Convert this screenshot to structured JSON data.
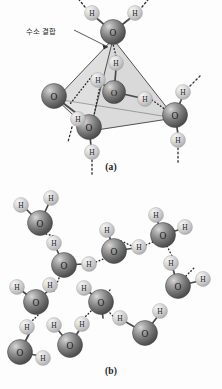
{
  "figure": {
    "background_color": "#fdfdfd",
    "annotations": {
      "hydrogen_bond_label": "수소 결합"
    },
    "captions": {
      "panel_a": "(a)",
      "panel_b": "(b)"
    },
    "atom_labels": {
      "oxygen": "O",
      "hydrogen": "H"
    },
    "colors": {
      "oxygen_sphere_dark": "#4f4f4f",
      "oxygen_sphere_mid": "#7d7d7d",
      "oxygen_sphere_light": "#b9b9b9",
      "hydrogen_sphere_dark": "#b0b0b0",
      "hydrogen_sphere_mid": "#d2d2d2",
      "hydrogen_sphere_light": "#eeeeee",
      "bond_line": "#4a4a4a",
      "hbond_dotted": "#3a3a3a",
      "tetrahedron_face": "#c9c9c9",
      "leader_line": "#3a3a3a",
      "label_text": "#1f1f1f"
    }
  },
  "panel_a": {
    "name": "tetrahedral-hydrogen-bond-arrangement",
    "tetrahedron": {
      "vertices": [
        {
          "id": "top",
          "x": 113,
          "y": 39
        },
        {
          "id": "left",
          "x": 56,
          "y": 99
        },
        {
          "id": "bottom",
          "x": 90,
          "y": 131
        },
        {
          "id": "right",
          "x": 175,
          "y": 118
        }
      ],
      "center": {
        "x": 114,
        "y": 92
      }
    },
    "oxygens": [
      {
        "id": "o-center",
        "label": "O",
        "x": 114,
        "y": 92,
        "r": 11.5
      },
      {
        "id": "o-top",
        "label": "O",
        "x": 113,
        "y": 32,
        "r": 12.5
      },
      {
        "id": "o-left",
        "label": "O",
        "x": 54,
        "y": 96,
        "r": 12.5
      },
      {
        "id": "o-bottom",
        "label": "O",
        "x": 89,
        "y": 127,
        "r": 12.5
      },
      {
        "id": "o-right",
        "label": "O",
        "x": 175,
        "y": 115,
        "r": 12.5
      }
    ],
    "hydrogens": [
      {
        "id": "h-top-left",
        "label": "H",
        "x": 92,
        "y": 13,
        "r": 7.5
      },
      {
        "id": "h-top-right",
        "label": "H",
        "x": 135,
        "y": 13,
        "r": 7.5
      },
      {
        "id": "h-center-up",
        "label": "H",
        "x": 116,
        "y": 63,
        "r": 7.5
      },
      {
        "id": "h-center-left",
        "label": "H",
        "x": 98,
        "y": 80,
        "r": 7.5
      },
      {
        "id": "h-center-right",
        "label": "H",
        "x": 145,
        "y": 99,
        "r": 7.5
      },
      {
        "id": "h-left-down",
        "label": "H",
        "x": 78,
        "y": 119,
        "r": 7.5
      },
      {
        "id": "h-bottom-down",
        "label": "H",
        "x": 92,
        "y": 152,
        "r": 7.5
      },
      {
        "id": "h-right-up",
        "label": "H",
        "x": 183,
        "y": 92,
        "r": 7.5
      },
      {
        "id": "h-right-down",
        "label": "H",
        "x": 178,
        "y": 140,
        "r": 7.5
      }
    ],
    "dashed_stubs": 6,
    "hydrogen_bonds_count": 4
  },
  "panel_b": {
    "name": "hydrogen-bonded-water-network",
    "oxygens": [
      {
        "id": "b-o1",
        "label": "O",
        "x": 40,
        "y": 223,
        "r": 12.5
      },
      {
        "id": "b-o2",
        "label": "O",
        "x": 64,
        "y": 265,
        "r": 12.5
      },
      {
        "id": "b-o3",
        "label": "O",
        "x": 114,
        "y": 251,
        "r": 12.5
      },
      {
        "id": "b-o4",
        "label": "O",
        "x": 163,
        "y": 235,
        "r": 12.5
      },
      {
        "id": "b-o5",
        "label": "O",
        "x": 36,
        "y": 302,
        "r": 12.5
      },
      {
        "id": "b-o6",
        "label": "O",
        "x": 101,
        "y": 302,
        "r": 12.5
      },
      {
        "id": "b-o7",
        "label": "O",
        "x": 178,
        "y": 286,
        "r": 12.5
      },
      {
        "id": "b-o8",
        "label": "O",
        "x": 20,
        "y": 352,
        "r": 12.5
      },
      {
        "id": "b-o9",
        "label": "O",
        "x": 70,
        "y": 345,
        "r": 12.5
      },
      {
        "id": "b-o10",
        "label": "O",
        "x": 145,
        "y": 333,
        "r": 12.5
      }
    ],
    "hydrogens": [
      {
        "id": "b-h1",
        "label": "H",
        "x": 21,
        "y": 205,
        "r": 7.5
      },
      {
        "id": "b-h2",
        "label": "H",
        "x": 51,
        "y": 198,
        "r": 7.5
      },
      {
        "id": "b-h3",
        "label": "H",
        "x": 54,
        "y": 243,
        "r": 7.5
      },
      {
        "id": "b-h4",
        "label": "H",
        "x": 89,
        "y": 264,
        "r": 7.5
      },
      {
        "id": "b-h5",
        "label": "H",
        "x": 107,
        "y": 230,
        "r": 7.5
      },
      {
        "id": "b-h6",
        "label": "H",
        "x": 139,
        "y": 247,
        "r": 7.5
      },
      {
        "id": "b-h7",
        "label": "H",
        "x": 156,
        "y": 215,
        "r": 7.5
      },
      {
        "id": "b-h8",
        "label": "H",
        "x": 185,
        "y": 227,
        "r": 7.5
      },
      {
        "id": "b-h9",
        "label": "H",
        "x": 171,
        "y": 263,
        "r": 7.5
      },
      {
        "id": "b-h10",
        "label": "H",
        "x": 203,
        "y": 279,
        "r": 7.5
      },
      {
        "id": "b-h11",
        "label": "H",
        "x": 17,
        "y": 287,
        "r": 7.5
      },
      {
        "id": "b-h12",
        "label": "H",
        "x": 50,
        "y": 285,
        "r": 7.5
      },
      {
        "id": "b-h13",
        "label": "H",
        "x": 84,
        "y": 288,
        "r": 7.5
      },
      {
        "id": "b-h14",
        "label": "H",
        "x": 27,
        "y": 327,
        "r": 7.5
      },
      {
        "id": "b-h15",
        "label": "H",
        "x": 54,
        "y": 325,
        "r": 7.5
      },
      {
        "id": "b-h16",
        "label": "H",
        "x": 82,
        "y": 324,
        "r": 7.5
      },
      {
        "id": "b-h17",
        "label": "H",
        "x": 120,
        "y": 318,
        "r": 7.5
      },
      {
        "id": "b-h18",
        "label": "H",
        "x": 160,
        "y": 311,
        "r": 7.5
      },
      {
        "id": "b-h19",
        "label": "H",
        "x": 43,
        "y": 358,
        "r": 7.5
      }
    ],
    "hydrogen_bonds_count": 9
  }
}
